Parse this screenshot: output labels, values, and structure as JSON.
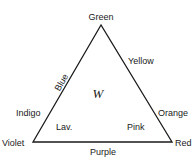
{
  "diagram": {
    "type": "color-triangle",
    "vertices": {
      "top": "Green",
      "bottom_left": "Violet",
      "bottom_right": "Red"
    },
    "edges": {
      "left_upper": "Blue",
      "left_lower": "Indigo",
      "right_upper": "Yellow",
      "right_lower": "Orange",
      "bottom": "Purple"
    },
    "interior": {
      "center": "W",
      "lower_left": "Lav.",
      "lower_right": "Pink"
    },
    "line_color": "#1a1a1a"
  }
}
